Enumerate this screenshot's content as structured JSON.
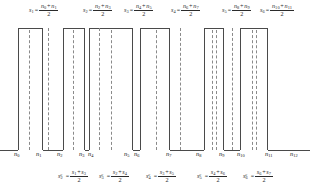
{
  "diagram": {
    "top_formulas": [
      {
        "lhs": "s",
        "lhs_sub": "1",
        "num_a": "n",
        "num_a_sub": "0",
        "num_b": "n",
        "num_b_sub": "1",
        "den": "2",
        "x": 29,
        "y": 3
      },
      {
        "lhs": "s",
        "lhs_sub": "2",
        "num_a": "n",
        "num_a_sub": "2",
        "num_b": "n",
        "num_b_sub": "3",
        "den": "2",
        "x": 83,
        "y": 3
      },
      {
        "lhs": "s",
        "lhs_sub": "3",
        "num_a": "n",
        "num_a_sub": "4",
        "num_b": "n",
        "num_b_sub": "5",
        "den": "2",
        "x": 124,
        "y": 3
      },
      {
        "lhs": "s",
        "lhs_sub": "4",
        "num_a": "n",
        "num_a_sub": "6",
        "num_b": "n",
        "num_b_sub": "7",
        "den": "2",
        "x": 171,
        "y": 3
      },
      {
        "lhs": "s",
        "lhs_sub": "5",
        "num_a": "n",
        "num_a_sub": "8",
        "num_b": "n",
        "num_b_sub": "9",
        "den": "2",
        "x": 222,
        "y": 3
      },
      {
        "lhs": "s",
        "lhs_sub": "6",
        "num_a": "n",
        "num_a_sub": "10",
        "num_b": "n",
        "num_b_sub": "11",
        "den": "2",
        "x": 260,
        "y": 3
      }
    ],
    "bottom_formulas": [
      {
        "lhs": "s",
        "lhs_sub": "2",
        "lhs_sup": "c",
        "num_a": "s",
        "num_a_sub": "1",
        "num_b": "s",
        "num_b_sub": "3",
        "den": "2",
        "x": 58,
        "y": 169
      },
      {
        "lhs": "s",
        "lhs_sub": "3",
        "lhs_sup": "c",
        "num_a": "s",
        "num_a_sub": "2",
        "num_b": "s",
        "num_b_sub": "4",
        "den": "2",
        "x": 99,
        "y": 169
      },
      {
        "lhs": "s",
        "lhs_sub": "4",
        "lhs_sup": "c",
        "num_a": "s",
        "num_a_sub": "3",
        "num_b": "s",
        "num_b_sub": "5",
        "den": "2",
        "x": 146,
        "y": 169
      },
      {
        "lhs": "s",
        "lhs_sub": "5",
        "lhs_sup": "c",
        "num_a": "s",
        "num_a_sub": "4",
        "num_b": "s",
        "num_b_sub": "6",
        "den": "2",
        "x": 197,
        "y": 169
      },
      {
        "lhs": "s",
        "lhs_sub": "6",
        "lhs_sup": "c",
        "num_a": "s",
        "num_a_sub": "6",
        "num_b": "s",
        "num_b_sub": "7",
        "den": "2",
        "x": 243,
        "y": 169
      }
    ],
    "pulses": [
      {
        "name": "pulse-1",
        "x": 18,
        "width": 25,
        "top": 28,
        "height": 122,
        "dash_x": 28.5
      },
      {
        "name": "pulse-2",
        "x": 63,
        "width": 22,
        "top": 28,
        "height": 122,
        "dash_x": 72.5
      },
      {
        "name": "pulse-3",
        "x": 89,
        "width": 44,
        "top": 28,
        "height": 122,
        "dash_x": 110.5
      },
      {
        "name": "pulse-4",
        "x": 140,
        "width": 30,
        "top": 28,
        "height": 122,
        "dash_x": 155.5
      },
      {
        "name": "pulse-5",
        "x": 204,
        "width": 20,
        "top": 28,
        "height": 122,
        "dash_x": 211.5,
        "dash_x2": 215.5
      },
      {
        "name": "pulse-6",
        "x": 240,
        "width": 28,
        "top": 28,
        "height": 122,
        "dash_x": 251.5,
        "dash_x2": 255.5
      }
    ],
    "baseline_segments": [
      {
        "x": 0,
        "width": 18
      },
      {
        "x": 43,
        "width": 20
      },
      {
        "x": 85,
        "width": 4
      },
      {
        "x": 133,
        "width": 7
      },
      {
        "x": 170,
        "width": 34
      },
      {
        "x": 224,
        "width": 16
      },
      {
        "x": 268,
        "width": 42
      }
    ],
    "extra_dashes": [
      {
        "x": 48,
        "top": 28,
        "height": 122
      },
      {
        "x": 99,
        "top": 28,
        "height": 122
      },
      {
        "x": 180,
        "top": 28,
        "height": 122
      },
      {
        "x": 232,
        "top": 28,
        "height": 122
      }
    ],
    "n_labels": [
      {
        "text": "n",
        "sub": "0",
        "x": 14,
        "y": 151
      },
      {
        "text": "n",
        "sub": "1",
        "x": 36,
        "y": 151
      },
      {
        "text": "n",
        "sub": "2",
        "x": 57,
        "y": 151
      },
      {
        "text": "n",
        "sub": "3",
        "x": 79,
        "y": 151
      },
      {
        "text": "n",
        "sub": "4",
        "x": 88,
        "y": 151
      },
      {
        "text": "n",
        "sub": "5",
        "x": 124,
        "y": 151
      },
      {
        "text": "n",
        "sub": "6",
        "x": 134,
        "y": 151
      },
      {
        "text": "n",
        "sub": "7",
        "x": 166,
        "y": 151
      },
      {
        "text": "n",
        "sub": "8",
        "x": 196,
        "y": 151
      },
      {
        "text": "n",
        "sub": "9",
        "x": 219,
        "y": 151
      },
      {
        "text": "n",
        "sub": "10",
        "x": 237,
        "y": 151
      },
      {
        "text": "n",
        "sub": "11",
        "x": 265,
        "y": 151
      },
      {
        "text": "n",
        "sub": "12",
        "x": 290,
        "y": 151
      }
    ],
    "colors": {
      "stroke": "#4a4a4a",
      "dash": "#8a8a8a",
      "text": "#1a1a1a",
      "background": "#ffffff"
    }
  }
}
